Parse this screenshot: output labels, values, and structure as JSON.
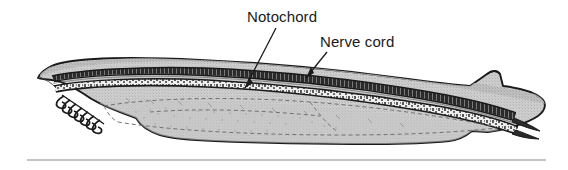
{
  "figure": {
    "kind": "biological-illustration",
    "background_color": "#ffffff",
    "outline_color": "#1a1a1a",
    "body_fill_color": "#cdcdcd",
    "body_shade_color": "#b9b9b9",
    "dark_band_color": "#2a2a2a",
    "speckle_band_color": "#f2f2f2",
    "dashed_internal_color": "#6e6e6e",
    "rule_color": "#8a8a8a"
  },
  "labels": [
    {
      "id": "notochord",
      "text": "Notochord",
      "x": 247,
      "y": 22,
      "leader_from_x": 276,
      "leader_from_y": 28,
      "leader_to_x": 245,
      "leader_to_y": 88
    },
    {
      "id": "nerve-cord",
      "text": "Nerve cord",
      "x": 320,
      "y": 47,
      "leader_from_x": 327,
      "leader_from_y": 52,
      "leader_to_x": 306,
      "leader_to_y": 78
    }
  ],
  "anatomy": {
    "notochord_label": "Notochord",
    "nerve_cord_label": "Nerve cord",
    "oral_cirri_count": 7
  },
  "rule": {
    "x1": 27,
    "x2": 546,
    "y": 160,
    "thickness": 1
  }
}
